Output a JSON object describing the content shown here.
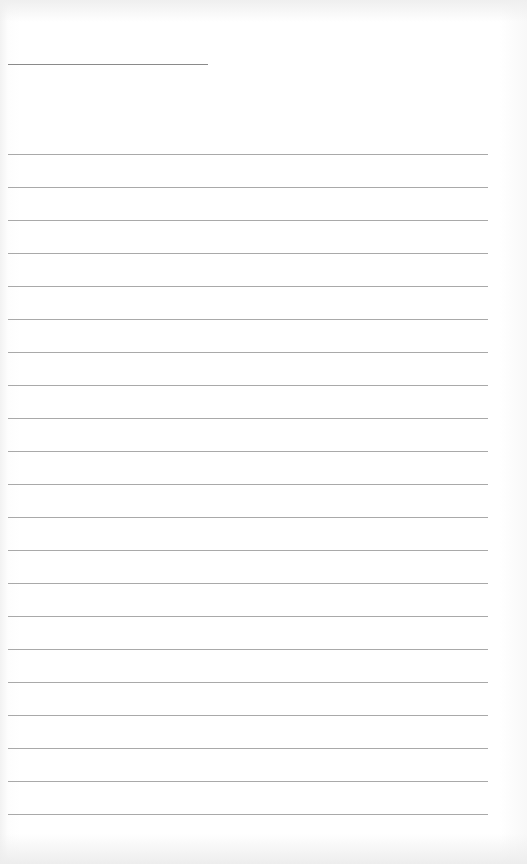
{
  "page": {
    "type": "lined-paper",
    "background": "#ffffff",
    "line_color": "#a9a9a9",
    "title_line": {
      "x": 8,
      "y": 64,
      "width": 200,
      "color": "#8a8a8a"
    },
    "rules": {
      "x": 8,
      "width": 480,
      "first_y": 154,
      "spacing": 33,
      "count": 21
    }
  }
}
